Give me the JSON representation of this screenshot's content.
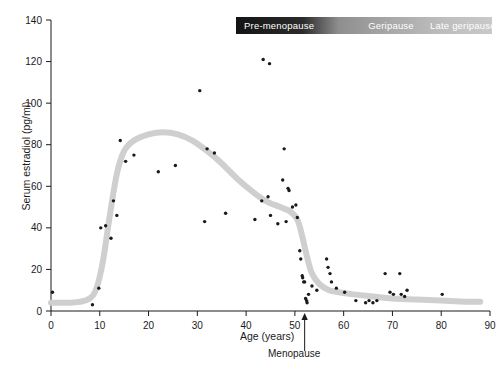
{
  "legend": {
    "segments": [
      {
        "label": "Pre-menopause",
        "color": "#141414"
      },
      {
        "label": "Geripause",
        "color": "#a8a8a8"
      },
      {
        "label": "Late geripause",
        "color": "#c6c6c6"
      }
    ]
  },
  "annotations": {
    "menopause_label": "Menopause",
    "menopause_age": 50
  },
  "chart_data": {
    "type": "scatter",
    "title": "",
    "xlabel": "Age (years)",
    "ylabel": "Serum estradiol (pg/ml)",
    "xlim": [
      0,
      90
    ],
    "ylim": [
      0,
      140
    ],
    "xticks": [
      0,
      10,
      20,
      30,
      40,
      50,
      60,
      70,
      80,
      90
    ],
    "yticks": [
      0,
      20,
      40,
      60,
      80,
      100,
      120,
      140
    ],
    "grid": false,
    "legend_position": "top-right",
    "series": [
      {
        "name": "Serum estradiol measurements",
        "type": "scatter",
        "marker_color": "#1a1a1a",
        "points": [
          [
            0.3,
            9
          ],
          [
            8.5,
            3
          ],
          [
            9.8,
            11
          ],
          [
            10.2,
            40
          ],
          [
            11.2,
            41
          ],
          [
            12.3,
            35
          ],
          [
            12.8,
            53
          ],
          [
            13.5,
            46
          ],
          [
            14.2,
            82
          ],
          [
            15.3,
            72
          ],
          [
            17.0,
            75
          ],
          [
            22.0,
            67
          ],
          [
            25.5,
            70
          ],
          [
            30.5,
            106
          ],
          [
            31.5,
            43
          ],
          [
            32.0,
            78
          ],
          [
            33.5,
            76
          ],
          [
            35.8,
            47
          ],
          [
            41.8,
            44
          ],
          [
            43.5,
            121
          ],
          [
            44.8,
            119
          ],
          [
            43.2,
            53
          ],
          [
            44.5,
            55
          ],
          [
            45.0,
            46
          ],
          [
            46.5,
            42
          ],
          [
            47.5,
            63
          ],
          [
            47.8,
            78
          ],
          [
            48.2,
            43
          ],
          [
            48.6,
            59
          ],
          [
            48.8,
            58
          ],
          [
            49.5,
            50
          ],
          [
            50.2,
            51
          ],
          [
            50.5,
            45
          ],
          [
            51.0,
            29
          ],
          [
            51.2,
            25
          ],
          [
            51.5,
            17
          ],
          [
            51.6,
            16
          ],
          [
            51.8,
            14
          ],
          [
            52.0,
            14
          ],
          [
            52.2,
            6
          ],
          [
            52.4,
            5
          ],
          [
            52.5,
            4
          ],
          [
            52.8,
            8
          ],
          [
            53.5,
            12
          ],
          [
            54.5,
            10
          ],
          [
            56.5,
            25
          ],
          [
            56.8,
            21
          ],
          [
            57.2,
            18
          ],
          [
            57.5,
            14
          ],
          [
            58.5,
            11
          ],
          [
            60.2,
            9
          ],
          [
            62.5,
            5
          ],
          [
            64.5,
            4
          ],
          [
            65.2,
            5
          ],
          [
            66.0,
            4
          ],
          [
            66.8,
            5
          ],
          [
            68.5,
            18
          ],
          [
            69.5,
            9
          ],
          [
            70.2,
            8
          ],
          [
            71.5,
            18
          ],
          [
            71.8,
            8
          ],
          [
            72.5,
            7
          ],
          [
            73.0,
            10
          ],
          [
            80.2,
            8
          ]
        ]
      },
      {
        "name": "Trend curve",
        "type": "line",
        "line_color": "#cfcfcf",
        "line_width": 6,
        "points": [
          [
            0,
            4
          ],
          [
            4,
            4
          ],
          [
            7,
            5
          ],
          [
            9,
            9
          ],
          [
            10.5,
            22
          ],
          [
            12,
            45
          ],
          [
            13.5,
            66
          ],
          [
            15,
            77
          ],
          [
            17,
            82
          ],
          [
            20,
            85
          ],
          [
            23,
            86
          ],
          [
            26,
            85
          ],
          [
            29,
            82
          ],
          [
            32,
            77
          ],
          [
            35,
            71
          ],
          [
            38,
            64
          ],
          [
            41,
            58
          ],
          [
            44,
            53
          ],
          [
            47,
            50
          ],
          [
            49,
            48
          ],
          [
            50.5,
            44
          ],
          [
            51.5,
            36
          ],
          [
            52.5,
            26
          ],
          [
            53.5,
            18
          ],
          [
            55,
            13
          ],
          [
            57,
            10
          ],
          [
            59,
            9
          ],
          [
            62,
            8
          ],
          [
            66,
            7
          ],
          [
            70,
            6
          ],
          [
            75,
            5.5
          ],
          [
            80,
            5
          ],
          [
            85,
            4.5
          ],
          [
            88,
            4.5
          ]
        ]
      }
    ]
  }
}
